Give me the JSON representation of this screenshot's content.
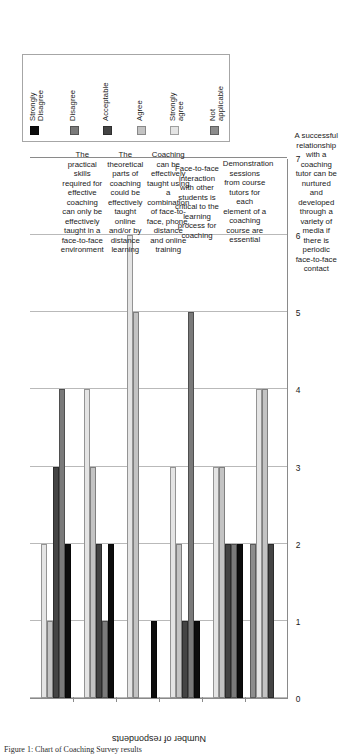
{
  "chart_data": {
    "type": "bar",
    "orientation": "horizontal-grouped",
    "title": "",
    "xlabel": "",
    "ylabel": "Number of respondents",
    "ylim": [
      0,
      7
    ],
    "yticks": [
      "0",
      "1",
      "2",
      "3",
      "4",
      "5",
      "6",
      "7"
    ],
    "grid": true,
    "legend_position": "top-left",
    "categories": [
      "The practical skills required for effective coaching can only be effectively taught in a face-to-face environment",
      "The theoretical parts of coaching could be effectively taught online and/or by distance learning",
      "Coaching can be effectively taught using a combination of face-to-face, phone, distance and online training",
      "Face-to-face interaction with other students is critical to the learning process for coaching",
      "Demonstration sessions from course tutors for each element of a coaching course are essential",
      "A successful relationship with a coaching tutor can be nurtured and developed through a variety of media if there is periodic face-to-face contact"
    ],
    "series": [
      {
        "name": "Strongly Disagree",
        "color": "#0d0d0d",
        "values": [
          2,
          2,
          1,
          1,
          2,
          0
        ]
      },
      {
        "name": "Disagree",
        "color": "#7a7a7a",
        "values": [
          4,
          1,
          0,
          5,
          2,
          0
        ]
      },
      {
        "name": "Acceptable",
        "color": "#444444",
        "values": [
          3,
          2,
          0,
          1,
          2,
          2
        ]
      },
      {
        "name": "Agree",
        "color": "#c3c3c3",
        "values": [
          1,
          3,
          5,
          2,
          3,
          4
        ]
      },
      {
        "name": "Strongly agree",
        "color": "#e4e4e4",
        "values": [
          2,
          4,
          6,
          3,
          3,
          4
        ]
      },
      {
        "name": "Not applicable",
        "color": "#8c8c8c",
        "values": [
          0,
          0,
          0,
          0,
          0,
          2
        ]
      }
    ]
  },
  "legend": {
    "entries": [
      {
        "label": "Strongly\nDisagree"
      },
      {
        "label": "Disagree"
      },
      {
        "label": "Acceptable"
      },
      {
        "label": "Agree"
      },
      {
        "label": "Strongly\nagree"
      },
      {
        "label": "Not\napplicable"
      }
    ]
  },
  "axis": {
    "title": "Number of respondents",
    "ticks": [
      "0",
      "1",
      "2",
      "3",
      "4",
      "5",
      "6",
      "7"
    ]
  },
  "caption": {
    "text": "Figure 1: Chart of Coaching Survey results"
  }
}
